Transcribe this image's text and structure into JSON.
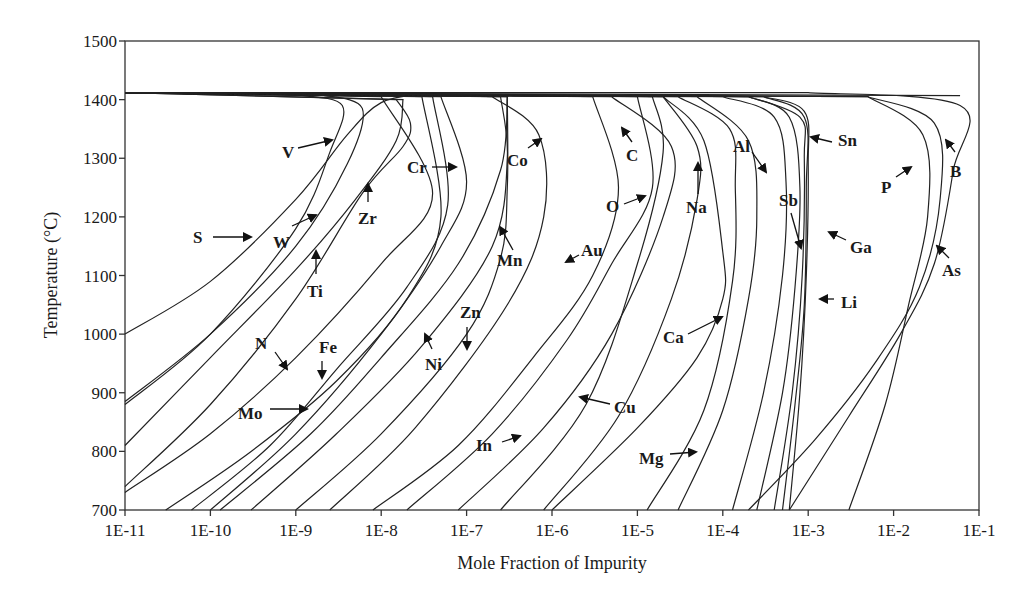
{
  "chart_data": {
    "type": "line",
    "title": "",
    "xlabel": "Mole Fraction of Impurity",
    "ylabel": "Temperature (°C)",
    "xscale": "log",
    "xlim": [
      1e-11,
      0.1
    ],
    "ylim": [
      700,
      1500
    ],
    "x_ticks": [
      "1E-11",
      "1E-10",
      "1E-9",
      "1E-8",
      "1E-7",
      "1E-6",
      "1E-5",
      "1E-4",
      "1E-3",
      "1E-2",
      "1E-1"
    ],
    "y_ticks": [
      "700",
      "800",
      "900",
      "1000",
      "1100",
      "1200",
      "1300",
      "1400",
      "1500"
    ],
    "grid": false,
    "legend": "none (curves labeled directly with arrows)",
    "melting_line_T": 1412,
    "series": [
      {
        "name": "S",
        "points": [
          [
            1e-11,
            1000
          ],
          [
            1e-10,
            1090
          ],
          [
            1e-09,
            1230
          ],
          [
            4e-09,
            1340
          ],
          [
            1e-08,
            1395
          ],
          [
            3e-08,
            1410
          ]
        ]
      },
      {
        "name": "V",
        "points": [
          [
            1e-11,
            880
          ],
          [
            1e-10,
            1000
          ],
          [
            1e-09,
            1180
          ],
          [
            2.5e-09,
            1310
          ],
          [
            3.5e-09,
            1390
          ],
          [
            1e-09,
            1408
          ]
        ]
      },
      {
        "name": "W",
        "points": [
          [
            1e-11,
            885
          ],
          [
            1e-10,
            1000
          ],
          [
            1e-09,
            1150
          ],
          [
            4e-09,
            1290
          ],
          [
            6e-09,
            1385
          ],
          [
            2e-09,
            1408
          ]
        ]
      },
      {
        "name": "Ti",
        "points": [
          [
            1e-11,
            810
          ],
          [
            1e-10,
            960
          ],
          [
            1e-09,
            1110
          ],
          [
            5e-09,
            1230
          ],
          [
            1.5e-08,
            1330
          ],
          [
            1.8e-08,
            1400
          ]
        ]
      },
      {
        "name": "Zr",
        "points": [
          [
            1e-11,
            740
          ],
          [
            1e-10,
            880
          ],
          [
            1e-09,
            1060
          ],
          [
            6e-09,
            1240
          ],
          [
            1.8e-08,
            1320
          ],
          [
            2.2e-08,
            1360
          ],
          [
            1.5e-08,
            1400
          ]
        ]
      },
      {
        "name": "N",
        "points": [
          [
            1e-11,
            730
          ],
          [
            1e-10,
            830
          ],
          [
            1e-09,
            960
          ],
          [
            1e-08,
            1120
          ],
          [
            4e-08,
            1240
          ],
          [
            1e-08,
            1405
          ]
        ]
      },
      {
        "name": "Mo",
        "points": [
          [
            3e-11,
            700
          ],
          [
            3e-10,
            800
          ],
          [
            3e-09,
            920
          ],
          [
            2e-08,
            1060
          ],
          [
            5e-08,
            1200
          ],
          [
            3e-08,
            1405
          ]
        ]
      },
      {
        "name": "Fe",
        "points": [
          [
            6e-11,
            700
          ],
          [
            5e-10,
            810
          ],
          [
            3e-09,
            940
          ],
          [
            2e-08,
            1080
          ],
          [
            6e-08,
            1220
          ],
          [
            4e-08,
            1405
          ]
        ]
      },
      {
        "name": "Cr",
        "points": [
          [
            1e-10,
            700
          ],
          [
            1e-09,
            830
          ],
          [
            1e-08,
            1000
          ],
          [
            5e-08,
            1150
          ],
          [
            1e-07,
            1260
          ],
          [
            5e-08,
            1405
          ]
        ]
      },
      {
        "name": "Ni",
        "points": [
          [
            1.3e-10,
            700
          ],
          [
            1.5e-09,
            830
          ],
          [
            1e-08,
            960
          ],
          [
            8e-08,
            1120
          ],
          [
            2.5e-07,
            1280
          ],
          [
            3e-07,
            1405
          ]
        ]
      },
      {
        "name": "Zn",
        "points": [
          [
            3e-10,
            700
          ],
          [
            3e-09,
            830
          ],
          [
            3e-08,
            980
          ],
          [
            2e-07,
            1150
          ],
          [
            3e-07,
            1300
          ],
          [
            2.5e-07,
            1405
          ]
        ]
      },
      {
        "name": "Mn",
        "points": [
          [
            1e-09,
            700
          ],
          [
            1e-08,
            830
          ],
          [
            1e-07,
            1000
          ],
          [
            2.5e-07,
            1130
          ],
          [
            3e-07,
            1250
          ],
          [
            3e-07,
            1405
          ]
        ]
      },
      {
        "name": "Co",
        "points": [
          [
            2.5e-09,
            700
          ],
          [
            2.5e-08,
            840
          ],
          [
            3e-07,
            1050
          ],
          [
            8e-07,
            1200
          ],
          [
            7e-07,
            1340
          ],
          [
            2e-07,
            1405
          ]
        ]
      },
      {
        "name": "In",
        "points": [
          [
            8e-09,
            700
          ],
          [
            8e-08,
            810
          ],
          [
            6e-07,
            960
          ],
          [
            3e-06,
            1100
          ],
          [
            6e-06,
            1250
          ],
          [
            3e-06,
            1405
          ]
        ]
      },
      {
        "name": "Au",
        "points": [
          [
            2e-08,
            700
          ],
          [
            2e-07,
            830
          ],
          [
            1.5e-06,
            990
          ],
          [
            5e-06,
            1120
          ],
          [
            1.5e-05,
            1250
          ],
          [
            1e-05,
            1405
          ]
        ]
      },
      {
        "name": "Cu",
        "points": [
          [
            8e-08,
            700
          ],
          [
            8e-07,
            840
          ],
          [
            5e-06,
            1000
          ],
          [
            2e-05,
            1200
          ],
          [
            2.5e-05,
            1320
          ],
          [
            5e-06,
            1405
          ]
        ]
      },
      {
        "name": "C",
        "points": [
          [
            2.5e-07,
            700
          ],
          [
            2.5e-06,
            880
          ],
          [
            1e-05,
            1120
          ],
          [
            2e-05,
            1310
          ],
          [
            1.5e-05,
            1405
          ]
        ]
      },
      {
        "name": "O",
        "points": [
          [
            8e-07,
            700
          ],
          [
            6e-06,
            860
          ],
          [
            2.5e-05,
            1060
          ],
          [
            5e-05,
            1230
          ],
          [
            5e-05,
            1320
          ],
          [
            2e-05,
            1405
          ]
        ]
      },
      {
        "name": "Ca",
        "points": [
          [
            1e-06,
            700
          ],
          [
            1e-05,
            840
          ],
          [
            5e-05,
            960
          ],
          [
            0.0001,
            1060
          ],
          [
            0.0001,
            1140
          ],
          [
            6e-05,
            1330
          ],
          [
            2e-05,
            1405
          ]
        ]
      },
      {
        "name": "Na",
        "points": [
          [
            1.3e-05,
            700
          ],
          [
            6e-05,
            870
          ],
          [
            0.00013,
            1090
          ],
          [
            0.00014,
            1250
          ],
          [
            0.00012,
            1350
          ],
          [
            3e-05,
            1405
          ]
        ]
      },
      {
        "name": "Mg",
        "points": [
          [
            3e-05,
            700
          ],
          [
            0.0001,
            870
          ],
          [
            0.0002,
            1060
          ],
          [
            0.00025,
            1200
          ],
          [
            0.0002,
            1330
          ],
          [
            5e-05,
            1405
          ]
        ]
      },
      {
        "name": "Al",
        "points": [
          [
            0.00013,
            700
          ],
          [
            0.0003,
            900
          ],
          [
            0.0005,
            1100
          ],
          [
            0.00055,
            1260
          ],
          [
            0.0004,
            1370
          ],
          [
            0.0001,
            1405
          ]
        ]
      },
      {
        "name": "Sb",
        "points": [
          [
            0.00025,
            700
          ],
          [
            0.0005,
            900
          ],
          [
            0.0007,
            1080
          ],
          [
            0.0008,
            1250
          ],
          [
            0.0006,
            1370
          ],
          [
            0.0002,
            1405
          ]
        ]
      },
      {
        "name": "Ga",
        "points": [
          [
            0.0004,
            700
          ],
          [
            0.00065,
            900
          ],
          [
            0.00085,
            1100
          ],
          [
            0.0009,
            1300
          ],
          [
            0.0008,
            1370
          ],
          [
            0.0002,
            1405
          ]
        ]
      },
      {
        "name": "Li",
        "points": [
          [
            0.0005,
            700
          ],
          [
            0.0007,
            880
          ],
          [
            0.0009,
            1050
          ],
          [
            0.00095,
            1250
          ],
          [
            0.0009,
            1370
          ],
          [
            0.0003,
            1405
          ]
        ]
      },
      {
        "name": "Sn",
        "points": [
          [
            0.0006,
            700
          ],
          [
            0.0008,
            900
          ],
          [
            0.00095,
            1100
          ],
          [
            0.001,
            1290
          ],
          [
            0.0009,
            1380
          ],
          [
            0.0003,
            1405
          ]
        ]
      },
      {
        "name": "As",
        "points": [
          [
            0.0002,
            700
          ],
          [
            0.0012,
            820
          ],
          [
            0.006,
            950
          ],
          [
            0.02,
            1080
          ],
          [
            0.035,
            1230
          ],
          [
            0.03,
            1360
          ],
          [
            0.005,
            1405
          ]
        ]
      },
      {
        "name": "P",
        "points": [
          [
            0.003,
            700
          ],
          [
            0.008,
            880
          ],
          [
            0.015,
            1050
          ],
          [
            0.025,
            1200
          ],
          [
            0.022,
            1340
          ],
          [
            0.005,
            1405
          ]
        ]
      },
      {
        "name": "B",
        "points": [
          [
            0.0006,
            700
          ],
          [
            0.003,
            860
          ],
          [
            0.012,
            1000
          ],
          [
            0.03,
            1120
          ],
          [
            0.05,
            1280
          ],
          [
            0.06,
            1390
          ],
          [
            0.001,
            1412
          ]
        ]
      }
    ]
  },
  "labels": {
    "S": {
      "text": "S",
      "x": 193,
      "y": 243
    },
    "V": {
      "text": "V",
      "x": 282,
      "y": 158
    },
    "W": {
      "text": "W",
      "x": 273,
      "y": 248
    },
    "Ti": {
      "text": "Ti",
      "x": 311,
      "y": 297
    },
    "Zr": {
      "text": "Zr",
      "x": 359,
      "y": 224
    },
    "Cr": {
      "text": "Cr",
      "x": 408,
      "y": 173
    },
    "Co": {
      "text": "Co",
      "x": 507,
      "y": 166
    },
    "C": {
      "text": "C",
      "x": 626,
      "y": 161
    },
    "O": {
      "text": "O",
      "x": 607,
      "y": 212
    },
    "Na": {
      "text": "Na",
      "x": 686,
      "y": 213
    },
    "Al": {
      "text": "Al",
      "x": 733,
      "y": 152
    },
    "Sn": {
      "text": "Sn",
      "x": 838,
      "y": 145
    },
    "Sb": {
      "text": "Sb",
      "x": 779,
      "y": 206
    },
    "Ga": {
      "text": "Ga",
      "x": 850,
      "y": 253
    },
    "Li": {
      "text": "Li",
      "x": 842,
      "y": 308
    },
    "P": {
      "text": "P",
      "x": 882,
      "y": 193
    },
    "B": {
      "text": "B",
      "x": 950,
      "y": 177
    },
    "As": {
      "text": "As",
      "x": 942,
      "y": 276
    },
    "Mn": {
      "text": "Mn",
      "x": 498,
      "y": 266
    },
    "Au": {
      "text": "Au",
      "x": 582,
      "y": 256
    },
    "N": {
      "text": "N",
      "x": 255,
      "y": 349
    },
    "Fe": {
      "text": "Fe",
      "x": 320,
      "y": 353
    },
    "Mo": {
      "text": "Mo",
      "x": 238,
      "y": 419
    },
    "Ni": {
      "text": "Ni",
      "x": 425,
      "y": 370
    },
    "Zn": {
      "text": "Zn",
      "x": 461,
      "y": 318
    },
    "Ca": {
      "text": "Ca",
      "x": 663,
      "y": 343
    },
    "Cu": {
      "text": "Cu",
      "x": 614,
      "y": 413
    },
    "In": {
      "text": "In",
      "x": 476,
      "y": 451
    },
    "Mg": {
      "text": "Mg",
      "x": 640,
      "y": 464
    }
  }
}
